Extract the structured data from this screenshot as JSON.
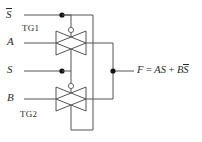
{
  "figure": {
    "kind": "logic-schematic",
    "background_color": "#ffffff",
    "wire_color": "#555555",
    "text_color": "#2b2b2b"
  },
  "inputs": [
    {
      "id": "sbar",
      "label": "S",
      "overbar": true,
      "y": 15,
      "description": "complement select input"
    },
    {
      "id": "a",
      "label": "A",
      "overbar": false,
      "y": 43,
      "description": "data input A"
    },
    {
      "id": "s",
      "label": "S",
      "overbar": false,
      "y": 71,
      "description": "select input"
    },
    {
      "id": "b",
      "label": "B",
      "overbar": false,
      "y": 99,
      "description": "data input B"
    }
  ],
  "gates": [
    {
      "id": "tg1",
      "label": "TG1",
      "label_x": 22,
      "label_y": 24,
      "center_x": 71,
      "center_y": 43,
      "n_control": "S",
      "p_control": "S-bar",
      "passes": "A"
    },
    {
      "id": "tg2",
      "label": "TG2",
      "label_x": 20,
      "label_y": 110,
      "center_x": 71,
      "center_y": 99,
      "n_control": "S-bar",
      "p_control": "S",
      "passes": "B"
    }
  ],
  "junctions": [
    {
      "id": "sbar-tap",
      "x": 62,
      "y": 15,
      "on": "S-bar line"
    },
    {
      "id": "s-tap",
      "x": 62,
      "y": 71,
      "on": "S line"
    },
    {
      "id": "output-node",
      "x": 113,
      "y": 71,
      "on": "output node F"
    }
  ],
  "output": {
    "label": "F",
    "equals": "=",
    "term1_var1": "A",
    "term1_var2": "S",
    "plus": "+",
    "term2_var1": "B",
    "term2_var2": "S",
    "term2_var2_overbar": true,
    "full_text": "F = AS + BS̅"
  },
  "bubbles": [
    {
      "id": "tg1-pmos-bubble",
      "x": 71,
      "y": 30,
      "r": 2.6,
      "meaning": "inverting (p-channel) control"
    },
    {
      "id": "tg2-pmos-bubble",
      "x": 71,
      "y": 86,
      "r": 2.6,
      "meaning": "inverting (p-channel) control"
    }
  ]
}
